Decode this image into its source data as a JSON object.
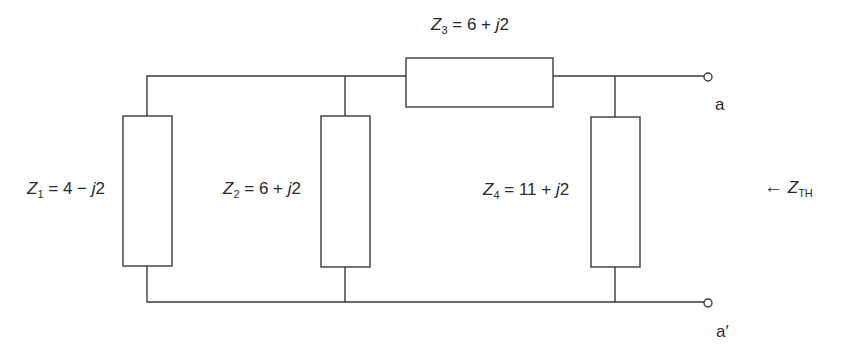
{
  "diagram": {
    "type": "circuit",
    "components": [
      {
        "id": "Z1",
        "symbol": "Z",
        "subscript": "1",
        "value": "= 4 − ",
        "imag": "j",
        "imag_val": "2",
        "connection": "shunt"
      },
      {
        "id": "Z2",
        "symbol": "Z",
        "subscript": "2",
        "value": "= 6 + ",
        "imag": "j",
        "imag_val": "2",
        "connection": "shunt"
      },
      {
        "id": "Z3",
        "symbol": "Z",
        "subscript": "3",
        "value": "= 6 + ",
        "imag": "j",
        "imag_val": "2",
        "connection": "series"
      },
      {
        "id": "Z4",
        "symbol": "Z",
        "subscript": "4",
        "value": "= 11 + ",
        "imag": "j",
        "imag_val": "2",
        "connection": "shunt"
      }
    ],
    "terminals": {
      "top": "a",
      "bottom": "a′"
    },
    "thevenin": {
      "arrow": "←",
      "symbol": "Z",
      "subscript": "TH"
    },
    "colors": {
      "line": "#3a3a3a",
      "text": "#2a2a2a",
      "background": "#ffffff"
    }
  }
}
